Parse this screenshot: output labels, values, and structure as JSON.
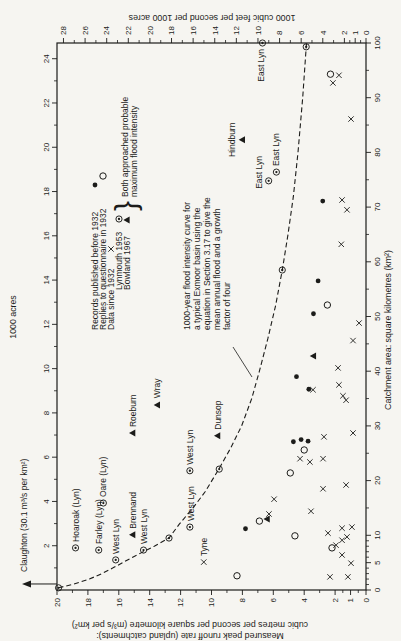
{
  "figure": {
    "ink": "#1c1c1a",
    "paper": "#f6f5f1"
  },
  "chart_data": {
    "type": "scatter",
    "plot": {
      "x": 51,
      "y": 57,
      "w": 547,
      "h": 309
    },
    "axes": {
      "bottom": {
        "title": "Catchment area: square kilometres (km²)",
        "min": 0,
        "max": 100,
        "labels": [
          0,
          5,
          10,
          20,
          30,
          40,
          50,
          60,
          70,
          80,
          90,
          100
        ],
        "minors": [
          1,
          2,
          3,
          4,
          6,
          7,
          8,
          9,
          15,
          25,
          35,
          45,
          55,
          65,
          75,
          85,
          95
        ]
      },
      "left": {
        "title_lines": [
          "Measured peak runoff rate (upland catchments):",
          "cubic metres per second per square kilometre (m³/s per km²)"
        ],
        "min": 0,
        "max": 20,
        "labels": [
          0,
          1,
          2,
          4,
          6,
          8,
          10,
          12,
          14,
          16,
          18,
          20
        ],
        "minors": [
          0.5,
          1.5,
          3,
          5,
          7,
          9,
          11,
          13,
          15,
          17,
          19
        ]
      },
      "top": {
        "title": "1000 acres",
        "km2_per_unit": 4.047,
        "labels": [
          2,
          4,
          6,
          8,
          10,
          12,
          14,
          16,
          18,
          20,
          22,
          24
        ],
        "minors": [
          1,
          3,
          5,
          7,
          9,
          11,
          13,
          15,
          17,
          19,
          21,
          23
        ]
      },
      "right": {
        "title": "1000 cubic feet per second per 1000 acres",
        "max_equiv": 28.6,
        "labels": [
          0,
          1,
          2,
          4,
          6,
          8,
          10,
          12,
          14,
          16,
          18,
          20,
          22,
          24,
          26,
          28
        ],
        "minors": [
          0.5,
          1.5,
          3,
          5,
          7,
          9,
          11,
          13,
          15,
          17,
          19,
          21,
          23,
          25,
          27
        ]
      }
    },
    "series": [
      {
        "name": "Records published before 1932",
        "marker": "dot",
        "points": [
          [
            11.2,
            7.8
          ],
          [
            27.1,
            4.7
          ],
          [
            27.5,
            4.2
          ],
          [
            27.2,
            3.75
          ],
          [
            36.7,
            3.7
          ],
          [
            39,
            4.5
          ],
          [
            50.5,
            3.4
          ],
          [
            56.5,
            3.1
          ],
          [
            71.1,
            2.8
          ]
        ]
      },
      {
        "name": "Replies to questionnaire in 1932",
        "marker": "circle",
        "points": [
          [
            2.6,
            8.35
          ],
          [
            7.7,
            2.2
          ],
          [
            9.9,
            4.6
          ],
          [
            12.6,
            6.9
          ],
          [
            21.4,
            4.9
          ],
          [
            25.6,
            4.0
          ],
          [
            52.1,
            2.5
          ],
          [
            94.3,
            2.3
          ]
        ]
      },
      {
        "name": "Data since 1932",
        "marker": "cross",
        "points": [
          [
            2.4,
            2.33
          ],
          [
            2.4,
            1.17
          ],
          [
            4.9,
            0.97
          ],
          [
            5.1,
            10.5
          ],
          [
            6.4,
            1.55
          ],
          [
            8.2,
            1.94
          ],
          [
            9.1,
            1.55
          ],
          [
            9.7,
            1.23
          ],
          [
            10.4,
            2.46
          ],
          [
            11.3,
            1.55
          ],
          [
            11.5,
            0.91
          ],
          [
            13.9,
            6.28
          ],
          [
            14.4,
            3.56
          ],
          [
            16.6,
            5.95
          ],
          [
            18.5,
            2.78
          ],
          [
            19.2,
            1.29
          ],
          [
            23.4,
            3.63
          ],
          [
            24.0,
            4.27
          ],
          [
            24.0,
            2.78
          ],
          [
            28.0,
            2.72
          ],
          [
            28.7,
            0.84
          ],
          [
            34.7,
            1.29
          ],
          [
            35.5,
            1.49
          ],
          [
            36.6,
            3.43
          ],
          [
            37.5,
            1.75
          ],
          [
            40.6,
            1.81
          ],
          [
            45.6,
            0.84
          ],
          [
            48.8,
            0.45
          ],
          [
            63.2,
            1.6
          ],
          [
            69.5,
            1.23
          ],
          [
            71.3,
            1.55
          ],
          [
            86.1,
            0.97
          ],
          [
            92.7,
            2.14
          ],
          [
            94.1,
            1.75
          ]
        ]
      },
      {
        "name": "Lynmouth 1953",
        "marker": "circdot",
        "points": [
          [
            7.7,
            18.8
          ],
          [
            7.3,
            17.3
          ],
          [
            15.9,
            17.0
          ],
          [
            5.5,
            16.2
          ],
          [
            7.3,
            14.4
          ],
          [
            11.5,
            11.4
          ],
          [
            21.8,
            11.4
          ],
          [
            74.8,
            6.3
          ],
          [
            76.4,
            5.8
          ],
          [
            100,
            6.7
          ],
          [
            0.4,
            19.9
          ],
          [
            9.5,
            12.75
          ],
          [
            22.1,
            9.5
          ],
          [
            58.5,
            5.42
          ],
          [
            99.3,
            3.87
          ]
        ]
      },
      {
        "name": "Bowland 1967",
        "marker": "triangle",
        "points": [
          [
            10.1,
            15.1
          ],
          [
            28.7,
            15.1
          ],
          [
            33.8,
            13.5
          ],
          [
            28.2,
            9.6
          ],
          [
            82.3,
            8.0
          ],
          [
            13.0,
            6.4
          ],
          [
            42.8,
            3.4
          ]
        ]
      }
    ],
    "point_labels": [
      {
        "text": "Hoaroak (Lyn)",
        "a": 7.7,
        "i": 18.8,
        "dx": 6,
        "dy": 3,
        "anchor": "start"
      },
      {
        "text": "Farley (Lyn)",
        "a": 7.3,
        "i": 17.3,
        "dx": 6,
        "dy": 3,
        "anchor": "start"
      },
      {
        "text": "Oare (Lyn)",
        "a": 15.9,
        "i": 17.0,
        "dx": 6,
        "dy": 3,
        "anchor": "start"
      },
      {
        "text": "West Lyn",
        "a": 5.5,
        "i": 16.2,
        "dx": 6,
        "dy": 3,
        "anchor": "start"
      },
      {
        "text": "Brennand",
        "a": 10.1,
        "i": 15.1,
        "dx": 6,
        "dy": 3,
        "anchor": "start"
      },
      {
        "text": "West Lyn",
        "a": 7.3,
        "i": 14.4,
        "dx": 6,
        "dy": 3,
        "anchor": "start"
      },
      {
        "text": "Roeburn",
        "a": 28.7,
        "i": 15.1,
        "dx": 6,
        "dy": 3,
        "anchor": "start"
      },
      {
        "text": "Wray",
        "a": 33.8,
        "i": 13.5,
        "dx": 7,
        "dy": 3,
        "anchor": "start"
      },
      {
        "text": "West Lyn",
        "a": 11.5,
        "i": 11.4,
        "dx": 6,
        "dy": 4,
        "anchor": "start"
      },
      {
        "text": "West Lyn",
        "a": 21.8,
        "i": 11.4,
        "dx": 6,
        "dy": 3,
        "anchor": "start"
      },
      {
        "text": "Dunsop",
        "a": 28.2,
        "i": 9.6,
        "dx": 6,
        "dy": 3,
        "anchor": "start"
      },
      {
        "text": "Tyne",
        "a": 5.1,
        "i": 10.5,
        "dx": 6,
        "dy": 3,
        "anchor": "start"
      },
      {
        "text": "Hindburn",
        "a": 82.3,
        "i": 8.0,
        "dx": 0,
        "dy": -7,
        "anchor": "middle"
      },
      {
        "text": "East Lyn",
        "a": 74.8,
        "i": 6.3,
        "dx": -8,
        "dy": -7,
        "anchor": "start"
      },
      {
        "text": "East Lyn",
        "a": 76.4,
        "i": 5.8,
        "dx": 6,
        "dy": 3,
        "anchor": "start"
      },
      {
        "text": "East Lyn",
        "a": 100,
        "i": 6.7,
        "dx": -6,
        "dy": 2,
        "anchor": "end"
      }
    ],
    "curve": {
      "name": "1000-year flood intensity curve",
      "dash": "5 3",
      "points": [
        [
          0.4,
          19.9
        ],
        [
          1,
          19.0
        ],
        [
          2,
          17.9
        ],
        [
          3,
          17.1
        ],
        [
          4,
          16.4
        ],
        [
          6,
          15.1
        ],
        [
          8,
          13.7
        ],
        [
          9.5,
          12.75
        ],
        [
          12,
          12.1
        ],
        [
          15,
          11.2
        ],
        [
          18,
          10.4
        ],
        [
          22,
          9.55
        ],
        [
          26,
          8.75
        ],
        [
          30,
          8.05
        ],
        [
          35,
          7.4
        ],
        [
          40,
          6.9
        ],
        [
          46,
          6.35
        ],
        [
          52,
          5.85
        ],
        [
          58.5,
          5.42
        ],
        [
          65,
          5.05
        ],
        [
          72,
          4.7
        ],
        [
          80,
          4.4
        ],
        [
          90,
          4.1
        ],
        [
          100,
          3.85
        ]
      ]
    },
    "legend": {
      "rows": [
        {
          "text": "Records published before 1932",
          "x": 311,
          "cy": 95,
          "marker": "dot",
          "symx": 456
        },
        {
          "text": "Replies to questionnaire in 1932",
          "x": 311,
          "cy": 103,
          "marker": "circle",
          "symx": 465
        },
        {
          "text": "Data since 1932",
          "x": 311,
          "cy": 111,
          "marker": "cross",
          "symx": 392
        },
        {
          "text": "Lynmouth 1953",
          "x": 351,
          "cy": 119,
          "marker": "circdot",
          "symx": 422
        },
        {
          "text": "Bowland 1967",
          "x": 351,
          "cy": 127,
          "marker": "triangle",
          "symx": 421
        }
      ],
      "brace": {
        "glyph": "}",
        "x": 430,
        "y": 136
      },
      "brace_lines": [
        {
          "text": "Both approached probable",
          "x": 444,
          "y": 128
        },
        {
          "text": "maximum flood intensity",
          "x": 444,
          "y": 136.5
        }
      ]
    },
    "annotation": {
      "lines": [
        "1000-year flood intensity curve for",
        "a typical Exmoor basin using the",
        "equation in Section 3.17 to give the",
        "mean annual flood and a growth",
        "factor of four"
      ],
      "x": 311,
      "y0": 190,
      "pitch": 10,
      "leader": {
        "x1": 294,
        "y1": 233,
        "x2": 264,
        "y2": 252
      }
    },
    "claughton": {
      "text": "Claughton (30.1 m³/s per km²)",
      "arrow_x_area": 1.1,
      "arrow_tip_y": 22,
      "text_x": 69,
      "text_y": 27
    },
    "titles": {
      "top": {
        "cx": 324,
        "y": 16
      },
      "bottom": {
        "cx": 311,
        "y": 391
      },
      "left": {
        "line_xs": [
          8,
          19
        ],
        "cy": 190
      },
      "right": {
        "x": 626,
        "cy": 212
      }
    }
  }
}
